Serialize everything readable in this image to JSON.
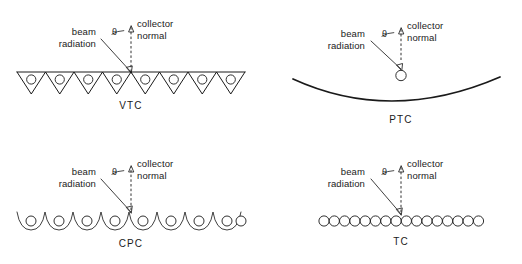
{
  "figure": {
    "background_color": "#ffffff",
    "line_color": "#1a1a1a",
    "annotation": {
      "beam_label_line1": "beam",
      "beam_label_line2": "radiation",
      "normal_label_line1": "collector",
      "normal_label_line2": "normal",
      "angle_symbol": "θ"
    }
  },
  "panels": [
    {
      "id": "vtc",
      "name": "VTC",
      "description": "V-trough collector",
      "receiver_count": 8,
      "beam_label_line1": "beam",
      "beam_label_line2": "radiation",
      "normal_label_line1": "collector",
      "normal_label_line2": "normal",
      "angle_symbol": "θ"
    },
    {
      "id": "ptc",
      "name": "PTC",
      "description": "Parabolic trough collector",
      "receiver_count": 1,
      "beam_label_line1": "beam",
      "beam_label_line2": "radiation",
      "normal_label_line1": "collector",
      "normal_label_line2": "normal",
      "angle_symbol": "θ"
    },
    {
      "id": "cpc",
      "name": "CPC",
      "description": "Compound parabolic concentrator",
      "receiver_count": 9,
      "beam_label_line1": "beam",
      "beam_label_line2": "radiation",
      "normal_label_line1": "collector",
      "normal_label_line2": "normal",
      "angle_symbol": "θ"
    },
    {
      "id": "tc",
      "name": "TC",
      "description": "Tubular collector",
      "receiver_count": 16,
      "beam_label_line1": "beam",
      "beam_label_line2": "radiation",
      "normal_label_line1": "collector",
      "normal_label_line2": "normal",
      "angle_symbol": "θ"
    }
  ]
}
